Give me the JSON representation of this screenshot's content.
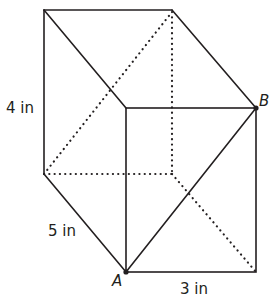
{
  "figure": {
    "type": "rectangular prism with diagonal",
    "dimension_labels": {
      "height": "4 in",
      "depth": "5 in",
      "width": "3 in"
    },
    "points": {
      "A": "A",
      "B": "B"
    },
    "colors": {
      "line": "#231f20",
      "background": "#ffffff"
    }
  }
}
